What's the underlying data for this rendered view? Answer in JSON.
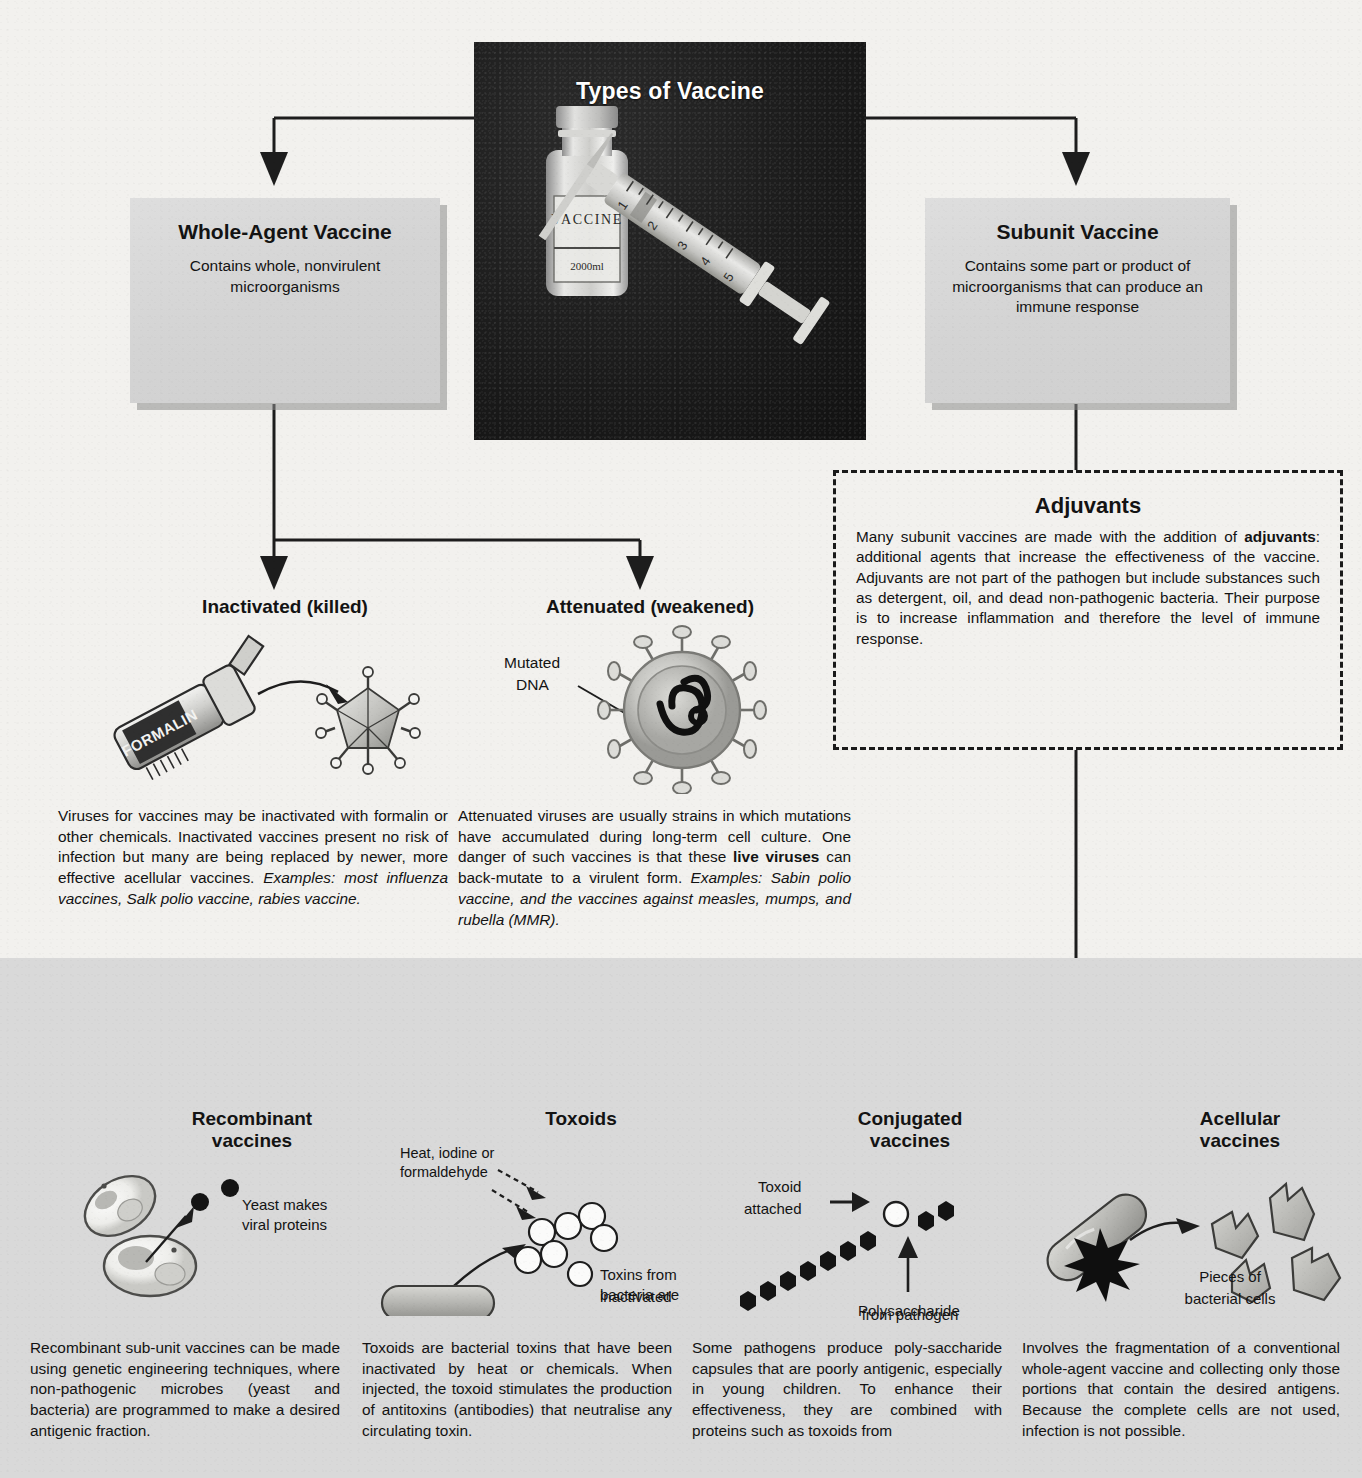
{
  "poster": {
    "title": "Types of Vaccine"
  },
  "photo": {
    "title": "Types of Vaccine",
    "vial_label": "VACCINE",
    "vial_volume": "2000ml",
    "syringe_marks": [
      "1",
      "2",
      "3",
      "4",
      "5"
    ]
  },
  "boxes": {
    "whole_agent": {
      "title": "Whole-Agent Vaccine",
      "body": "Contains whole, nonvirulent microorganisms"
    },
    "subunit": {
      "title": "Subunit Vaccine",
      "body": "Contains some part or product of microorganisms that can produce an immune response"
    },
    "adjuvants": {
      "title": "Adjuvants",
      "body_1": "Many subunit vaccines are made with the addition of ",
      "body_bold": "adjuvants",
      "body_2": ": additional agents that increase the effectiveness of the vaccine. Adjuvants are not part of the pathogen but include substances such as detergent, oil, and dead non-pathogenic bacteria. Their purpose is to increase inflammation and therefore the level of immune response."
    }
  },
  "whole_agent_branches": {
    "inactivated": {
      "heading": "Inactivated (killed)",
      "icon_label": "FORMALIN",
      "body_plain": "Viruses for vaccines may be inactivated with formalin or other chemicals. Inactivated vaccines present no risk of infection but many are being replaced by newer, more effective acellular vaccines. ",
      "body_italic": "Examples: most influenza vaccines, Salk polio vaccine, rabies vaccine."
    },
    "attenuated": {
      "heading": "Attenuated (weakened)",
      "icon_caption": "Mutated DNA",
      "body_1": "Attenuated viruses are usually strains in which mutations have accumulated during long-term cell culture. One danger of such vaccines is that these ",
      "body_bold": "live viruses",
      "body_2": " can back-mutate to a virulent form. ",
      "body_italic": "Examples: Sabin polio vaccine, and the vaccines against measles, mumps, and rubella (MMR)."
    }
  },
  "subunit_branches": [
    {
      "heading_line1": "Recombinant",
      "heading_line2": "vaccines",
      "caption": "Yeast makes viral proteins",
      "body": "Recombinant sub-unit vaccines can be made using genetic engineering techniques, where non-pathogenic microbes (yeast and bacteria) are programmed to make a desired antigenic fraction."
    },
    {
      "heading_line1": "Toxoids",
      "heading_line2": "",
      "caption": "Toxins from bacteria are inactivated",
      "caption_2": "Heat, iodine or formaldehyde",
      "body": "Toxoids are bacterial toxins that have been inactivated by heat or chemicals. When injected, the toxoid stimulates the production of antitoxins (antibodies) that neutralise any circulating toxin."
    },
    {
      "heading_line1": "Conjugated",
      "heading_line2": "vaccines",
      "caption": "Toxoid attached",
      "caption_2": "Polysaccharide from pathogen",
      "body": "Some pathogens produce poly-saccharide capsules that are poorly antigenic, especially in young children. To enhance their effectiveness, they are combined with proteins such as toxoids from"
    },
    {
      "heading_line1": "Acellular",
      "heading_line2": "vaccines",
      "caption": "Pieces of bacterial cells",
      "body": "Involves the fragmentation of a conventional whole-agent vaccine and collecting only those portions that contain the desired antigens. Because the complete cells are not used, infection is not possible."
    }
  ],
  "colors": {
    "paper": "#f2f1ee",
    "box_grey": "#d6d6d6",
    "panel_grey": "#d9d9d9",
    "photo_black": "#1b1b1b",
    "ink": "#131313"
  }
}
